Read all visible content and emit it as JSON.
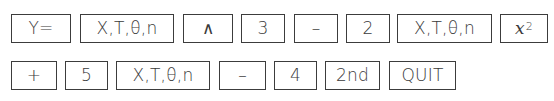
{
  "row1": [
    {
      "label": "Y=",
      "left": 11,
      "width": 60
    },
    {
      "label": "X,T,θ,n",
      "left": 80,
      "width": 94
    },
    {
      "label": "∧",
      "left": 183,
      "width": 50
    },
    {
      "label": "3",
      "left": 241,
      "width": 44
    },
    {
      "label": "–",
      "left": 294,
      "width": 44
    },
    {
      "label": "2",
      "left": 346,
      "width": 44
    },
    {
      "label": "X,T,θ,n",
      "left": 397,
      "width": 95
    },
    {
      "label": "x",
      "sup": "2",
      "left": 500,
      "width": 48
    }
  ],
  "row2": [
    {
      "label": "+",
      "left": 11,
      "width": 46
    },
    {
      "label": "5",
      "left": 65,
      "width": 43
    },
    {
      "label": "X,T,θ,n",
      "left": 116,
      "width": 94
    },
    {
      "label": "–",
      "left": 219,
      "width": 47
    },
    {
      "label": "4",
      "left": 274,
      "width": 43
    },
    {
      "label": "2nd",
      "left": 325,
      "width": 55
    },
    {
      "label": "QUIT",
      "left": 389,
      "width": 67
    }
  ],
  "layout": {
    "row1_top": 14,
    "row2_top": 61,
    "key_height": 29
  },
  "colors": {
    "border": "#3c3c3c",
    "text": "#3a3a3a",
    "background": "#ffffff"
  }
}
